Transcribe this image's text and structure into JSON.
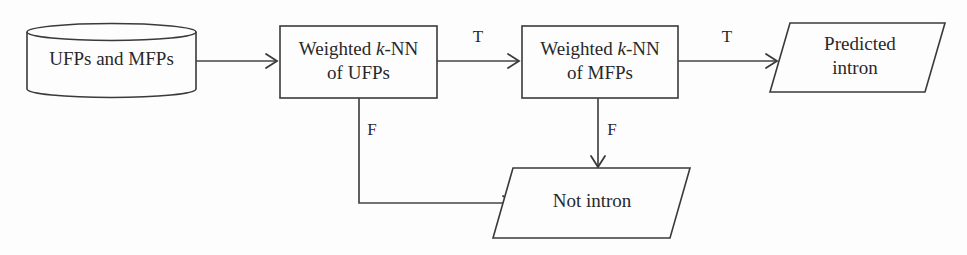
{
  "diagram": {
    "background_color": "#fdfdfd",
    "stroke_color": "#3a3a3c",
    "text_color": "#28282b",
    "nodes": {
      "datastore": {
        "shape": "cylinder",
        "label": "UFPs and MFPs"
      },
      "knn_ufp": {
        "shape": "process-box",
        "label_line1_prefix": "Weighted ",
        "label_line1_italic": "k",
        "label_line1_suffix": "-NN",
        "label_line2": "of UFPs"
      },
      "knn_mfp": {
        "shape": "process-box",
        "label_line1_prefix": "Weighted ",
        "label_line1_italic": "k",
        "label_line1_suffix": "-NN",
        "label_line2": "of MFPs"
      },
      "predicted_intron": {
        "shape": "parallelogram",
        "label_line1": "Predicted",
        "label_line2": "intron"
      },
      "not_intron": {
        "shape": "parallelogram",
        "label_line1": "Not intron"
      }
    },
    "edges": {
      "datastore_to_ufp": {
        "label": ""
      },
      "ufp_true_to_mfp": {
        "label": "T"
      },
      "mfp_true_to_predicted": {
        "label": "T"
      },
      "ufp_false_to_not_intron": {
        "label": "F"
      },
      "mfp_false_to_not_intron": {
        "label": "F"
      }
    }
  }
}
